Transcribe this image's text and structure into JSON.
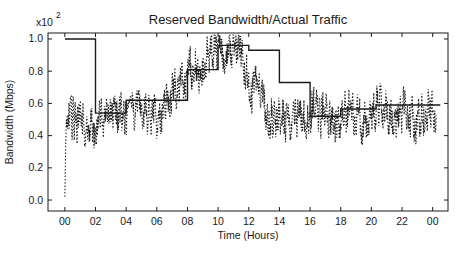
{
  "chart_data": {
    "type": "line",
    "title": "Reserved Bandwidth/Actual Traffic",
    "xlabel": "Time (Hours)",
    "ylabel": "Bandwidth (Mbps)",
    "y_scale_label": "x10",
    "y_scale_exponent": "2",
    "xlim": [
      -1.1,
      25.0
    ],
    "ylim": [
      -0.068,
      1.037
    ],
    "xticks": [
      0,
      2,
      4,
      6,
      8,
      10,
      12,
      14,
      16,
      18,
      20,
      22,
      24
    ],
    "xtick_labels": [
      "00",
      "02",
      "04",
      "06",
      "08",
      "10",
      "12",
      "14",
      "16",
      "18",
      "20",
      "22",
      "00"
    ],
    "yticks": [
      0.0,
      0.2,
      0.4,
      0.6,
      0.8,
      1.0
    ],
    "ytick_labels": [
      "0.0",
      "0.2",
      "0.4",
      "0.6",
      "0.8",
      "1.0"
    ],
    "grid": false,
    "background_color": "#ffffff",
    "line_color": "#1a1a1a",
    "legend": "none",
    "series": [
      {
        "name": "Reserved Bandwidth",
        "style": "solid-step",
        "steps": [
          {
            "from": 0,
            "to": 2,
            "value": 1.0
          },
          {
            "from": 2,
            "to": 4,
            "value": 0.54
          },
          {
            "from": 4,
            "to": 8,
            "value": 0.62
          },
          {
            "from": 8,
            "to": 10,
            "value": 0.81
          },
          {
            "from": 10,
            "to": 12,
            "value": 0.96
          },
          {
            "from": 12,
            "to": 14,
            "value": 0.93
          },
          {
            "from": 14,
            "to": 16,
            "value": 0.73
          },
          {
            "from": 16,
            "to": 18,
            "value": 0.52
          },
          {
            "from": 18,
            "to": 20.3,
            "value": 0.565
          },
          {
            "from": 20.3,
            "to": 24.5,
            "value": 0.59
          }
        ]
      },
      {
        "name": "Actual Traffic",
        "style": "dotted-noisy",
        "anchors": [
          [
            0,
            0.02
          ],
          [
            0.04,
            0.25
          ],
          [
            0.12,
            0.44
          ],
          [
            0.35,
            0.5
          ],
          [
            0.7,
            0.5
          ],
          [
            1.0,
            0.48
          ],
          [
            1.4,
            0.45
          ],
          [
            1.8,
            0.43
          ],
          [
            2.1,
            0.45
          ],
          [
            2.5,
            0.52
          ],
          [
            2.9,
            0.55
          ],
          [
            3.3,
            0.58
          ],
          [
            3.7,
            0.52
          ],
          [
            4.0,
            0.46
          ],
          [
            4.4,
            0.53
          ],
          [
            4.8,
            0.56
          ],
          [
            5.2,
            0.55
          ],
          [
            5.6,
            0.53
          ],
          [
            6.0,
            0.51
          ],
          [
            6.4,
            0.56
          ],
          [
            6.8,
            0.63
          ],
          [
            7.1,
            0.7
          ],
          [
            7.4,
            0.68
          ],
          [
            7.8,
            0.74
          ],
          [
            8.1,
            0.8
          ],
          [
            8.4,
            0.84
          ],
          [
            8.7,
            0.79
          ],
          [
            9.0,
            0.86
          ],
          [
            9.4,
            0.91
          ],
          [
            9.8,
            0.95
          ],
          [
            10.1,
            0.94
          ],
          [
            10.5,
            0.9
          ],
          [
            10.8,
            0.92
          ],
          [
            11.1,
            0.95
          ],
          [
            11.4,
            0.9
          ],
          [
            11.7,
            0.83
          ],
          [
            12.0,
            0.7
          ],
          [
            12.3,
            0.67
          ],
          [
            12.6,
            0.74
          ],
          [
            12.9,
            0.65
          ],
          [
            13.2,
            0.54
          ],
          [
            13.6,
            0.47
          ],
          [
            14.0,
            0.5
          ],
          [
            14.5,
            0.47
          ],
          [
            15.0,
            0.51
          ],
          [
            15.5,
            0.48
          ],
          [
            16.0,
            0.55
          ],
          [
            16.3,
            0.58
          ],
          [
            16.7,
            0.52
          ],
          [
            17.0,
            0.55
          ],
          [
            17.4,
            0.46
          ],
          [
            17.8,
            0.5
          ],
          [
            18.2,
            0.54
          ],
          [
            18.6,
            0.55
          ],
          [
            19.0,
            0.53
          ],
          [
            19.4,
            0.48
          ],
          [
            19.8,
            0.52
          ],
          [
            20.2,
            0.55
          ],
          [
            20.6,
            0.6
          ],
          [
            21.0,
            0.56
          ],
          [
            21.4,
            0.48
          ],
          [
            21.8,
            0.52
          ],
          [
            22.2,
            0.58
          ],
          [
            22.6,
            0.52
          ],
          [
            23.0,
            0.48
          ],
          [
            23.4,
            0.54
          ],
          [
            23.8,
            0.56
          ],
          [
            24.1,
            0.54
          ],
          [
            24.25,
            0.57
          ]
        ],
        "noise": {
          "seed": 20,
          "step": 0.02,
          "walk_gain": 0.62,
          "walk_input": 0.24,
          "clamp": 0.13,
          "jitter": 0.03,
          "value_max": 1.025,
          "value_min": 0.0
        }
      }
    ]
  }
}
